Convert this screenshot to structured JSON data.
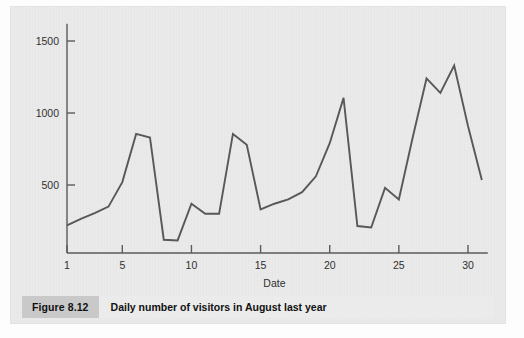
{
  "figure": {
    "tag": "Figure 8.12",
    "caption": "Daily number of visitors in August last year"
  },
  "colors": {
    "page_background": "#ebebeb",
    "line": "#585858",
    "axis": "#5b5b5b",
    "tag_background": "#c9c9c9",
    "text": "#111111"
  },
  "chart_data": {
    "type": "line",
    "title": "Daily number of visitors in August last year",
    "xlabel": "Date",
    "ylabel": "",
    "xlim": [
      1,
      31
    ],
    "ylim": [
      0,
      1620
    ],
    "grid": false,
    "legend": null,
    "x_ticks": [
      1,
      5,
      10,
      15,
      20,
      25,
      30
    ],
    "x_tick_labels": [
      "1",
      "5",
      "10",
      "15",
      "20",
      "25",
      "30"
    ],
    "y_ticks": [
      500,
      1000,
      1500
    ],
    "y_tick_labels": [
      "500",
      "1000",
      "1500"
    ],
    "x": [
      1,
      2,
      3,
      4,
      5,
      6,
      7,
      8,
      9,
      10,
      11,
      12,
      13,
      14,
      15,
      16,
      17,
      18,
      19,
      20,
      21,
      22,
      23,
      24,
      25,
      26,
      27,
      28,
      29,
      30,
      31
    ],
    "series": [
      {
        "name": "Daily visitors",
        "values": [
          220,
          265,
          305,
          350,
          520,
          855,
          830,
          120,
          115,
          370,
          300,
          300,
          855,
          780,
          330,
          370,
          400,
          450,
          560,
          790,
          1105,
          215,
          205,
          480,
          400,
          830,
          1240,
          1140,
          1330,
          910,
          535
        ]
      }
    ]
  }
}
